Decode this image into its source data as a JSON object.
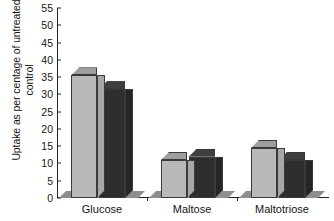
{
  "chart_data": {
    "type": "bar",
    "title": "",
    "subtitle": "",
    "xlabel": "",
    "ylabel": "Uptake as per centage of untreated control",
    "ylabel_lines": [
      "Uptake as per centage of untreated",
      "control"
    ],
    "categories": [
      "Glucose",
      "Maltose",
      "Maltotriose"
    ],
    "series": [
      {
        "name": "light-gray-series",
        "color": "#b9b9b9",
        "values": [
          35.5,
          11,
          14.5
        ]
      },
      {
        "name": "dark-series",
        "color": "#2e2e2e",
        "values": [
          31.5,
          12,
          11
        ]
      }
    ],
    "ylim": [
      0,
      55
    ],
    "ytick_step": 5,
    "ytick_labels": [
      "0",
      "5",
      "10",
      "15",
      "20",
      "25",
      "30",
      "35",
      "40",
      "45",
      "50",
      "55"
    ],
    "ytick_values": [
      0,
      5,
      10,
      15,
      20,
      25,
      30,
      35,
      40,
      45,
      50,
      55
    ],
    "grid": false,
    "legend": null,
    "legend_position": "none",
    "style": "3d-bars",
    "colors": {
      "light_front": "#b9b9b9",
      "light_top": "#9d9d9d",
      "light_side": "#a7a7a7",
      "dark_front": "#2e2e2e",
      "dark_top": "#3f3f3f",
      "dark_side": "#262626",
      "floor": "#8e8e8e",
      "axis": "#262626",
      "text": "#151515",
      "background": "#ffffff"
    }
  }
}
